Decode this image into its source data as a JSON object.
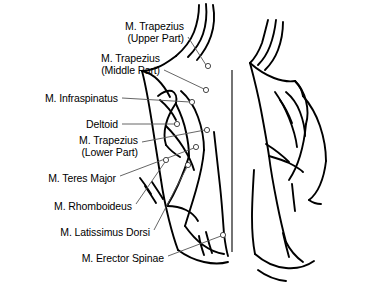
{
  "figure": {
    "background_color": "#ffffff",
    "ink_color": "#000000",
    "leader_color": "#555555",
    "width": 381,
    "height": 296,
    "views": [
      {
        "name": "posterior-view-left",
        "description": "Annotated back view with muscle callouts"
      },
      {
        "name": "oblique-view-right",
        "description": "Unlabeled oblique back view"
      }
    ],
    "divider": {
      "x": 232,
      "y1": 70,
      "y2": 252
    }
  },
  "labels": [
    {
      "id": "trapezius-upper",
      "line1": "M. Trapezius",
      "line2": "(Upper Part)",
      "text_x": 96,
      "text_y": 20,
      "text_w": 88,
      "leader": {
        "x1": 188,
        "y1": 37,
        "x2": 206,
        "y2": 65
      },
      "marker": {
        "cx": 208,
        "cy": 66
      }
    },
    {
      "id": "trapezius-middle",
      "line1": "M. Trapezius",
      "line2": "(Middle Part)",
      "text_x": 68,
      "text_y": 52,
      "text_w": 92,
      "leader": {
        "x1": 164,
        "y1": 70,
        "x2": 204,
        "y2": 89
      },
      "marker": {
        "cx": 206,
        "cy": 90
      }
    },
    {
      "id": "infraspinatus",
      "line1": "M. Infraspinatus",
      "line2": "",
      "text_x": 18,
      "text_y": 92,
      "text_w": 100,
      "leader": {
        "x1": 122,
        "y1": 98,
        "x2": 190,
        "y2": 102
      },
      "marker": {
        "cx": 192,
        "cy": 102
      }
    },
    {
      "id": "deltoid",
      "line1": "Deltoid",
      "line2": "",
      "text_x": 62,
      "text_y": 118,
      "text_w": 56,
      "leader": {
        "x1": 122,
        "y1": 124,
        "x2": 175,
        "y2": 124
      },
      "marker": {
        "cx": 177,
        "cy": 124
      }
    },
    {
      "id": "trapezius-lower",
      "line1": "M. Trapezius",
      "line2": "(Lower Part)",
      "text_x": 46,
      "text_y": 134,
      "text_w": 92,
      "leader": {
        "x1": 142,
        "y1": 142,
        "x2": 205,
        "y2": 130
      },
      "marker": {
        "cx": 207,
        "cy": 130
      }
    },
    {
      "id": "teres-major",
      "line1": "M. Teres Major",
      "line2": "",
      "text_x": 16,
      "text_y": 172,
      "text_w": 100,
      "leader": {
        "x1": 120,
        "y1": 176,
        "x2": 194,
        "y2": 148
      },
      "marker": {
        "cx": 196,
        "cy": 147
      }
    },
    {
      "id": "rhomboideus",
      "line1": "M. Rhomboideus",
      "line2": "",
      "text_x": 22,
      "text_y": 200,
      "text_w": 110,
      "leader": {
        "x1": 136,
        "y1": 204,
        "x2": 165,
        "y2": 162
      },
      "marker": {
        "cx": 166,
        "cy": 160
      }
    },
    {
      "id": "latissimus-dorsi",
      "line1": "M. Latissimus Dorsi",
      "line2": "",
      "text_x": 24,
      "text_y": 226,
      "text_w": 126,
      "leader": {
        "x1": 154,
        "y1": 230,
        "x2": 187,
        "y2": 167
      },
      "marker": {
        "cx": 188,
        "cy": 165
      }
    },
    {
      "id": "erector-spinae",
      "line1": "M. Erector Spinae",
      "line2": "",
      "text_x": 42,
      "text_y": 252,
      "text_w": 122,
      "leader": {
        "x1": 168,
        "y1": 256,
        "x2": 221,
        "y2": 236
      },
      "marker": {
        "cx": 223,
        "cy": 235
      }
    }
  ]
}
